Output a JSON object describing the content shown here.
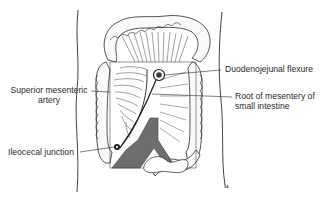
{
  "figure": {
    "type": "anatomical illustration",
    "colors": {
      "ink": "#2a2a2a",
      "artery": "#6e6e6e",
      "background": "#ffffff"
    }
  },
  "labels": {
    "superior_mesenteric_artery": {
      "line1": "Superior mesenteric",
      "line2": "artery"
    },
    "duodenojejunal_flexure": "Duodenojejunal flexure",
    "root_of_mesentery": {
      "line1": "Root of mesentery of",
      "line2": "small intestine"
    },
    "ileocecal_junction": "Ileocecal junction",
    "artist_mark": "54"
  }
}
